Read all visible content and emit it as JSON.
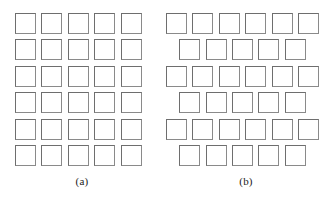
{
  "figure": {
    "background_color": "#ffffff",
    "square_stroke_color": "#7c7c7c",
    "square_fill_color": "#ffffff",
    "panels": [
      {
        "id": "a",
        "caption": "(a)",
        "arrangement": "square-lattice",
        "left_offset_px": 15,
        "rows": [
          {
            "count": 5,
            "offset": 0
          },
          {
            "count": 5,
            "offset": 0
          },
          {
            "count": 5,
            "offset": 0
          },
          {
            "count": 5,
            "offset": 0
          },
          {
            "count": 5,
            "offset": 0
          },
          {
            "count": 5,
            "offset": 0
          }
        ]
      },
      {
        "id": "b",
        "caption": "(b)",
        "arrangement": "staggered-lattice",
        "left_offset_px": 2,
        "rows": [
          {
            "count": 6,
            "offset": 0
          },
          {
            "count": 5,
            "offset": 13.2
          },
          {
            "count": 6,
            "offset": 0
          },
          {
            "count": 5,
            "offset": 13.2
          },
          {
            "count": 6,
            "offset": 0
          },
          {
            "count": 5,
            "offset": 13.2
          }
        ]
      }
    ]
  }
}
